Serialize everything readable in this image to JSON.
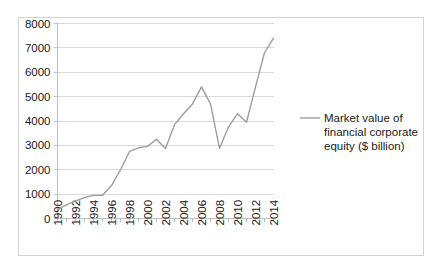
{
  "chart_data": {
    "type": "line",
    "title": "",
    "xlabel": "",
    "ylabel": "",
    "xlim": [
      1990,
      2014
    ],
    "ylim": [
      0,
      8000
    ],
    "grid": true,
    "legend_position": "right",
    "y_ticks": [
      "0",
      "1000",
      "2000",
      "3000",
      "4000",
      "5000",
      "6000",
      "7000",
      "8000"
    ],
    "y_tick_values": [
      0,
      1000,
      2000,
      3000,
      4000,
      5000,
      6000,
      7000,
      8000
    ],
    "x_tick_labels": [
      "1990",
      "1992",
      "1994",
      "1996",
      "1998",
      "2000",
      "2002",
      "2004",
      "2006",
      "2008",
      "2010",
      "2012",
      "2014"
    ],
    "x": [
      1990,
      1991,
      1992,
      1993,
      1994,
      1995,
      1996,
      1997,
      1998,
      1999,
      2000,
      2001,
      2002,
      2003,
      2004,
      2005,
      2006,
      2007,
      2008,
      2009,
      2010,
      2011,
      2012,
      2013,
      2014
    ],
    "series": [
      {
        "name": "Market value of financial corporate equity ($ billion)",
        "color": "#9e9e9e",
        "values": [
          370,
          560,
          720,
          860,
          950,
          950,
          1350,
          2000,
          2750,
          2900,
          2960,
          3250,
          2870,
          3850,
          4300,
          4700,
          5400,
          4700,
          2880,
          3750,
          4300,
          3950,
          5400,
          6800,
          7400
        ]
      }
    ],
    "legend": [
      {
        "label_lines": [
          "Market value of",
          "financial corporate",
          "equity ($ billion)"
        ],
        "color": "#9e9e9e"
      }
    ],
    "colors": {
      "line": "#9e9e9e",
      "gridline": "#d9d9d9",
      "axis": "#bfbfbf",
      "border": "#d3d3d3",
      "text": "#1a1a1a",
      "background": "#ffffff"
    }
  }
}
